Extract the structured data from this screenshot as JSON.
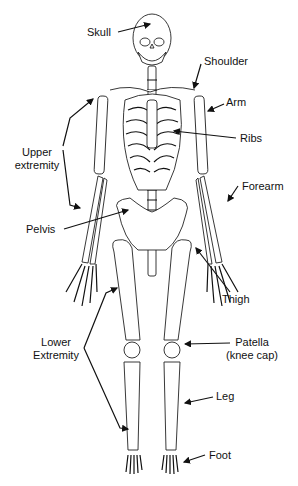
{
  "labels": {
    "skull": "Skull",
    "shoulder": "Shoulder",
    "arm": "Arm",
    "ribs": "Ribs",
    "upper_extremity_1": "Upper",
    "upper_extremity_2": "extremity",
    "forearm": "Forearm",
    "pelvis": "Pelvis",
    "thigh": "Thigh",
    "lower_extremity_1": "Lower",
    "lower_extremity_2": "Extremity",
    "patella_1": "Patella",
    "patella_2": "(knee cap)",
    "leg": "Leg",
    "foot": "Foot"
  },
  "colors": {
    "line": "#111111",
    "background": "#ffffff"
  }
}
